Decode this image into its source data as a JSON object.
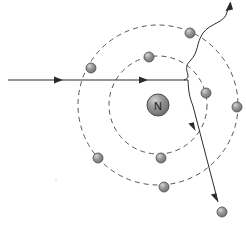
{
  "figure": {
    "name": "electron-scattering-atom-diagram",
    "background_color": "#ffffff",
    "width": 246,
    "height": 225
  },
  "nucleus": {
    "label": "N",
    "cx": 158,
    "cy": 105,
    "r": 11,
    "fill_color": "#8c8c8c",
    "edge_color": "#4d4d4d",
    "highlight_color": "#c9c9c9",
    "label_color": "#1a1a1a"
  },
  "shells": [
    {
      "name": "inner-shell",
      "cx": 158,
      "cy": 105,
      "r": 49,
      "style": "dashed",
      "stroke_color": "#555555",
      "stroke_width": 1,
      "dash_pattern": "5,4"
    },
    {
      "name": "outer-shell",
      "cx": 158,
      "cy": 105,
      "r": 80,
      "style": "dashed",
      "stroke_color": "#555555",
      "stroke_width": 1,
      "dash_pattern": "5,4"
    }
  ],
  "electrons": [
    {
      "name": "electron-inner-top",
      "shell": "inner",
      "cx": 149,
      "cy": 57,
      "r": 5
    },
    {
      "name": "electron-inner-right",
      "shell": "inner",
      "cx": 206,
      "cy": 93,
      "r": 5
    },
    {
      "name": "electron-inner-bottom",
      "shell": "inner",
      "cx": 161,
      "cy": 158,
      "r": 5
    },
    {
      "name": "electron-outer-topleft",
      "shell": "outer",
      "cx": 91,
      "cy": 68,
      "r": 5
    },
    {
      "name": "electron-outer-topright",
      "shell": "outer",
      "cx": 190,
      "cy": 33,
      "r": 5
    },
    {
      "name": "electron-outer-right",
      "shell": "outer",
      "cx": 237,
      "cy": 107,
      "r": 5
    },
    {
      "name": "electron-outer-botleft",
      "shell": "outer",
      "cx": 98,
      "cy": 158,
      "r": 5
    },
    {
      "name": "electron-outer-bottom",
      "shell": "outer",
      "cx": 164,
      "cy": 187,
      "r": 5
    },
    {
      "name": "electron-scattered",
      "shell": "free",
      "cx": 222,
      "cy": 212,
      "r": 5
    }
  ],
  "electron_style": {
    "fill_color": "#8f8f8f",
    "edge_color": "#4d4d4d",
    "highlight_color": "#d0d0d0"
  },
  "tracks": [
    {
      "name": "incoming-electron-track",
      "role": "incident electron beam",
      "path": "M 8 80 L 188 80",
      "stroke_color": "#2b2b2b",
      "stroke_width": 1,
      "arrowheads": [
        {
          "name": "incoming-arrowhead",
          "x": 63,
          "y": 80,
          "angle": 0
        },
        {
          "name": "incoming-arrowhead-mid",
          "x": 148,
          "y": 80,
          "angle": 0
        }
      ]
    },
    {
      "name": "deflected-electron-track",
      "role": "scattered electron after interaction",
      "path": "M 188 80 C 188 92, 190 98, 196 110 L 218 202",
      "stroke_color": "#2b2b2b",
      "stroke_width": 1,
      "arrowheads": [
        {
          "name": "deflected-arrowhead-mid",
          "x": 194,
          "y": 130,
          "angle": 77
        },
        {
          "name": "deflected-arrowhead-end",
          "x": 218,
          "y": 202,
          "angle": 77
        }
      ]
    },
    {
      "name": "emitted-photon-track",
      "role": "bremsstrahlung photon (wavy)",
      "path": "M 185 80 C 195 76, 182 68, 193 58 C 204 48, 200 40, 206 30 C 212 20, 226 22, 228 10 L 231 3",
      "stroke_color": "#2b2b2b",
      "stroke_width": 1,
      "arrowheads": [
        {
          "name": "photon-arrowhead",
          "x": 231,
          "y": 2,
          "angle": -70
        }
      ]
    }
  ],
  "faint_mark": {
    "name": "faint-smudge",
    "cx": 56,
    "cy": 180,
    "r": 1.5,
    "color": "#ededed"
  }
}
